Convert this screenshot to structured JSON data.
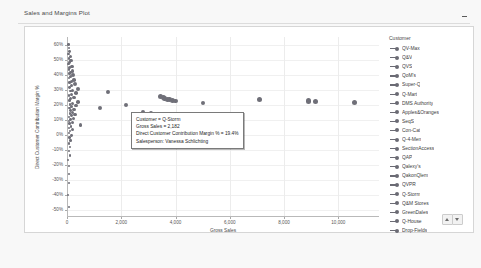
{
  "panel": {
    "title": "Sales and Margins Plot",
    "minimize_label": "Minimize"
  },
  "legend": {
    "title": "Customer",
    "items": [
      {
        "label": "QV-Max"
      },
      {
        "label": "Q&V"
      },
      {
        "label": "QVS"
      },
      {
        "label": "QoM's"
      },
      {
        "label": "Super-Q"
      },
      {
        "label": "Q-Mart"
      },
      {
        "label": "DMS Authority"
      },
      {
        "label": "Apples&Oranges"
      },
      {
        "label": "SeqS"
      },
      {
        "label": "Con-Cat"
      },
      {
        "label": "Q-4-Men"
      },
      {
        "label": "SectionAccess"
      },
      {
        "label": "QAP"
      },
      {
        "label": "Qalexy's"
      },
      {
        "label": "QakonQlem"
      },
      {
        "label": "QVPR"
      },
      {
        "label": "Q-Storm"
      },
      {
        "label": "Q&M Stores"
      },
      {
        "label": "GreenDales"
      },
      {
        "label": "Q-House"
      },
      {
        "label": "Drop-Fields"
      }
    ],
    "scroll_up_label": "Scroll legend up",
    "scroll_down_label": "Scroll legend down"
  },
  "tooltip": {
    "lines": [
      "Customer = Q-Storm",
      "Gross Sales = 2,182",
      "Direct Customer Contribution Margin % = 19.4%",
      "Salesperson: Vanessa Schlichting"
    ],
    "line1": "Customer = Q-Storm",
    "line2": "Gross Sales = 2,182",
    "line3": "Direct Customer Contribution Margin % = 19.4%",
    "line4": "Salesperson: Vanessa Schlichting"
  },
  "chart_data": {
    "type": "scatter",
    "title": "Sales and Margins Plot",
    "xlabel": "Gross Sales",
    "ylabel": "Direct Customer Contribution Margin %",
    "xlim": [
      0,
      11500
    ],
    "ylim": [
      -0.55,
      0.65
    ],
    "grid": true,
    "legend_position": "right",
    "xticks": [
      0,
      2000,
      4000,
      6000,
      8000,
      10000
    ],
    "xtick_labels": [
      "0",
      "2,000",
      "4,000",
      "6,000",
      "8,000",
      "10,000"
    ],
    "yticks": [
      0.6,
      0.5,
      0.4,
      0.3,
      0.2,
      0.1,
      0,
      -0.1,
      -0.2,
      -0.3,
      -0.4,
      -0.5
    ],
    "ytick_labels": [
      "60%",
      "50%",
      "40%",
      "30%",
      "20%",
      "10%",
      "0%",
      "-10%",
      "-20%",
      "-30%",
      "-40%",
      "-50%"
    ],
    "marker_color": "#6f6f78",
    "points": [
      {
        "x": 60,
        "y": 0.6,
        "r": 1.3
      },
      {
        "x": 75,
        "y": 0.575,
        "r": 1.2
      },
      {
        "x": 90,
        "y": 0.555,
        "r": 1.4
      },
      {
        "x": 55,
        "y": 0.535,
        "r": 1.2
      },
      {
        "x": 120,
        "y": 0.52,
        "r": 1.5
      },
      {
        "x": 70,
        "y": 0.505,
        "r": 1.3
      },
      {
        "x": 150,
        "y": 0.495,
        "r": 1.6
      },
      {
        "x": 95,
        "y": 0.48,
        "r": 1.4
      },
      {
        "x": 60,
        "y": 0.47,
        "r": 1.2
      },
      {
        "x": 180,
        "y": 0.455,
        "r": 1.7
      },
      {
        "x": 110,
        "y": 0.445,
        "r": 1.5
      },
      {
        "x": 70,
        "y": 0.435,
        "r": 1.3
      },
      {
        "x": 200,
        "y": 0.425,
        "r": 1.8
      },
      {
        "x": 130,
        "y": 0.415,
        "r": 1.4
      },
      {
        "x": 85,
        "y": 0.405,
        "r": 1.3
      },
      {
        "x": 230,
        "y": 0.395,
        "r": 1.9
      },
      {
        "x": 140,
        "y": 0.385,
        "r": 1.5
      },
      {
        "x": 65,
        "y": 0.375,
        "r": 1.2
      },
      {
        "x": 260,
        "y": 0.365,
        "r": 1.8
      },
      {
        "x": 160,
        "y": 0.355,
        "r": 1.5
      },
      {
        "x": 90,
        "y": 0.345,
        "r": 1.3
      },
      {
        "x": 310,
        "y": 0.335,
        "r": 2.0
      },
      {
        "x": 180,
        "y": 0.325,
        "r": 1.6
      },
      {
        "x": 100,
        "y": 0.315,
        "r": 1.4
      },
      {
        "x": 400,
        "y": 0.305,
        "r": 2.1
      },
      {
        "x": 210,
        "y": 0.295,
        "r": 1.7
      },
      {
        "x": 120,
        "y": 0.29,
        "r": 1.4
      },
      {
        "x": 1500,
        "y": 0.285,
        "r": 1.9
      },
      {
        "x": 330,
        "y": 0.275,
        "r": 1.8
      },
      {
        "x": 150,
        "y": 0.268,
        "r": 1.5
      },
      {
        "x": 80,
        "y": 0.26,
        "r": 1.3
      },
      {
        "x": 3450,
        "y": 0.252,
        "r": 2.6
      },
      {
        "x": 3560,
        "y": 0.245,
        "r": 2.6
      },
      {
        "x": 3600,
        "y": 0.24,
        "r": 2.2
      },
      {
        "x": 3700,
        "y": 0.235,
        "r": 2.6
      },
      {
        "x": 3780,
        "y": 0.232,
        "r": 2.4
      },
      {
        "x": 3880,
        "y": 0.228,
        "r": 2.7
      },
      {
        "x": 4000,
        "y": 0.222,
        "r": 2.2
      },
      {
        "x": 260,
        "y": 0.245,
        "r": 1.7
      },
      {
        "x": 140,
        "y": 0.238,
        "r": 1.5
      },
      {
        "x": 90,
        "y": 0.228,
        "r": 1.3
      },
      {
        "x": 7100,
        "y": 0.232,
        "r": 2.7
      },
      {
        "x": 8900,
        "y": 0.222,
        "r": 2.8
      },
      {
        "x": 9150,
        "y": 0.218,
        "r": 2.6
      },
      {
        "x": 10600,
        "y": 0.212,
        "r": 2.8
      },
      {
        "x": 5000,
        "y": 0.208,
        "r": 2.1
      },
      {
        "x": 400,
        "y": 0.215,
        "r": 1.8
      },
      {
        "x": 200,
        "y": 0.208,
        "r": 1.6
      },
      {
        "x": 110,
        "y": 0.2,
        "r": 1.4
      },
      {
        "x": 2182,
        "y": 0.194,
        "r": 2.1
      },
      {
        "x": 330,
        "y": 0.192,
        "r": 1.7
      },
      {
        "x": 180,
        "y": 0.185,
        "r": 1.5
      },
      {
        "x": 95,
        "y": 0.178,
        "r": 1.3
      },
      {
        "x": 1200,
        "y": 0.175,
        "r": 2.0
      },
      {
        "x": 260,
        "y": 0.168,
        "r": 1.6
      },
      {
        "x": 140,
        "y": 0.16,
        "r": 1.4
      },
      {
        "x": 2800,
        "y": 0.152,
        "r": 2.2
      },
      {
        "x": 3100,
        "y": 0.145,
        "r": 1.9
      },
      {
        "x": 200,
        "y": 0.148,
        "r": 1.5
      },
      {
        "x": 105,
        "y": 0.14,
        "r": 1.3
      },
      {
        "x": 300,
        "y": 0.132,
        "r": 1.7
      },
      {
        "x": 160,
        "y": 0.125,
        "r": 1.4
      },
      {
        "x": 85,
        "y": 0.118,
        "r": 1.2
      },
      {
        "x": 230,
        "y": 0.108,
        "r": 1.6
      },
      {
        "x": 130,
        "y": 0.1,
        "r": 1.4
      },
      {
        "x": 70,
        "y": 0.092,
        "r": 1.2
      },
      {
        "x": 190,
        "y": 0.082,
        "r": 1.5
      },
      {
        "x": 100,
        "y": 0.072,
        "r": 1.3
      },
      {
        "x": 500,
        "y": 0.062,
        "r": 1.8
      },
      {
        "x": 150,
        "y": 0.055,
        "r": 1.4
      },
      {
        "x": 80,
        "y": 0.045,
        "r": 1.2
      },
      {
        "x": 220,
        "y": 0.032,
        "r": 1.5
      },
      {
        "x": 110,
        "y": 0.022,
        "r": 1.3
      },
      {
        "x": 60,
        "y": 0.01,
        "r": 1.1
      },
      {
        "x": 170,
        "y": -0.005,
        "r": 1.4
      },
      {
        "x": 90,
        "y": -0.02,
        "r": 1.2
      },
      {
        "x": 140,
        "y": -0.04,
        "r": 1.3
      },
      {
        "x": 75,
        "y": -0.06,
        "r": 1.1
      },
      {
        "x": 120,
        "y": -0.085,
        "r": 1.2
      },
      {
        "x": 65,
        "y": -0.11,
        "r": 1.1
      },
      {
        "x": 100,
        "y": -0.14,
        "r": 1.2
      },
      {
        "x": 55,
        "y": -0.17,
        "r": 1.0
      },
      {
        "x": 85,
        "y": -0.21,
        "r": 1.1
      },
      {
        "x": 60,
        "y": -0.26,
        "r": 1.0
      },
      {
        "x": 70,
        "y": -0.32,
        "r": 1.0
      },
      {
        "x": 50,
        "y": -0.4,
        "r": 1.0
      },
      {
        "x": 65,
        "y": -0.48,
        "r": 1.0
      }
    ]
  }
}
